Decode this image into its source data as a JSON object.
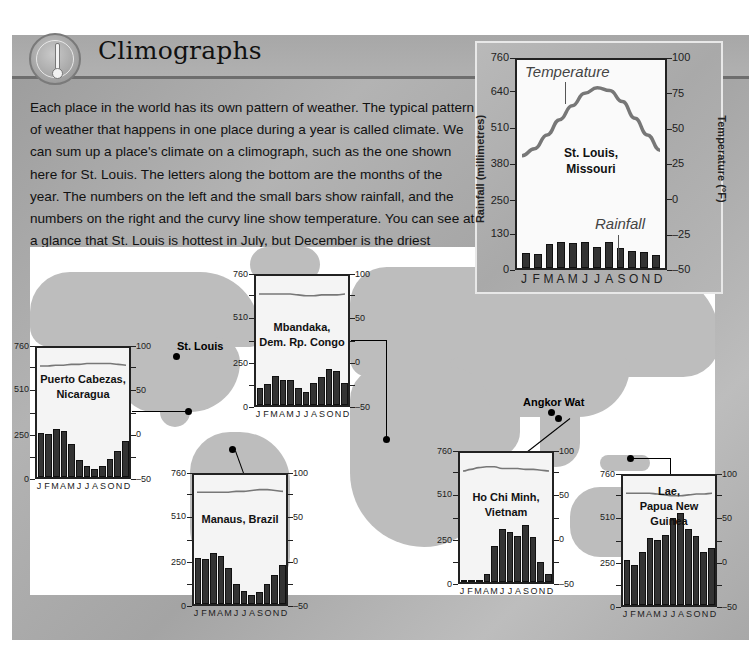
{
  "header": {
    "title": "Climographs",
    "icon": "thermometer-icon"
  },
  "intro_text": "Each place in the world has its own pattern of weather. The typical pattern of weather that happens in one place during a year is called climate. We can sum up a place's climate on a climograph, such as the one shown here for St. Louis. The letters along the bottom are the months of the year. The numbers on the left and the small bars show rainfall, and the numbers on the right and the curvy line show temperature. You can see at a glance that St. Louis is hottest in July, but December is the driest month.",
  "map": {
    "labels": {
      "st_louis": "St. Louis",
      "angkor_wat": "Angkor Wat"
    }
  },
  "colors": {
    "panel": "#a8a8a8",
    "bars": "#333333",
    "temperature_line": "#777777",
    "plot_bg": "#f4f4f4"
  },
  "chart_data": [
    {
      "type": "bar",
      "id": "st_louis",
      "title": "St. Louis, Missouri",
      "title_lines": [
        "St. Louis,",
        "Missouri"
      ],
      "categories": [
        "J",
        "F",
        "M",
        "A",
        "M",
        "J",
        "J",
        "A",
        "S",
        "O",
        "N",
        "D"
      ],
      "ylabel": "Rainfall (millimetres)",
      "y2label": "Temperature (°F)",
      "ylim": [
        0,
        760
      ],
      "y2lim": [
        -50,
        100
      ],
      "yticks": [
        0,
        130,
        250,
        380,
        510,
        640,
        760
      ],
      "y2ticks": [
        -50,
        -25,
        0,
        25,
        50,
        75,
        100
      ],
      "annotations": [
        "Temperature",
        "Rainfall"
      ],
      "series": [
        {
          "name": "Rainfall",
          "type": "bar",
          "values": [
            55,
            52,
            88,
            95,
            92,
            95,
            78,
            95,
            72,
            62,
            60,
            48
          ]
        },
        {
          "name": "Temperature",
          "type": "line",
          "values": [
            31,
            36,
            46,
            57,
            67,
            76,
            80,
            78,
            70,
            58,
            46,
            35
          ]
        }
      ]
    },
    {
      "type": "bar",
      "id": "puerto_cabezas",
      "title": "Puerto Cabezas, Nicaragua",
      "title_lines": [
        "Puerto Cabezas,",
        "Nicaragua"
      ],
      "categories": [
        "J",
        "F",
        "M",
        "A",
        "M",
        "J",
        "J",
        "A",
        "S",
        "O",
        "N",
        "D"
      ],
      "ylim": [
        0,
        760
      ],
      "y2lim": [
        -50,
        100
      ],
      "yticks": [
        0,
        250,
        510,
        760
      ],
      "y2ticks": [
        -50,
        0,
        50,
        100
      ],
      "series": [
        {
          "name": "Rainfall",
          "type": "bar",
          "values": [
            258,
            255,
            285,
            272,
            195,
            100,
            62,
            48,
            62,
            108,
            155,
            215
          ]
        },
        {
          "name": "Temperature",
          "type": "line",
          "values": [
            79,
            79,
            80,
            80,
            81,
            81,
            82,
            82,
            82,
            82,
            81,
            80
          ]
        }
      ]
    },
    {
      "type": "bar",
      "id": "mbandaka",
      "title": "Mbandaka, Dem. Rp. Congo",
      "title_lines": [
        "Mbandaka,",
        "Dem. Rp. Congo"
      ],
      "categories": [
        "J",
        "F",
        "M",
        "A",
        "M",
        "J",
        "J",
        "A",
        "S",
        "O",
        "N",
        "D"
      ],
      "ylim": [
        0,
        760
      ],
      "y2lim": [
        -50,
        100
      ],
      "yticks": [
        0,
        250,
        510,
        760
      ],
      "y2ticks": [
        -50,
        0,
        50,
        100
      ],
      "series": [
        {
          "name": "Rainfall",
          "type": "bar",
          "values": [
            100,
            125,
            170,
            150,
            148,
            98,
            75,
            130,
            165,
            215,
            200,
            128
          ]
        },
        {
          "name": "Temperature",
          "type": "line",
          "values": [
            79,
            79,
            79,
            79,
            79,
            78,
            77,
            77,
            78,
            78,
            78,
            79
          ]
        }
      ]
    },
    {
      "type": "bar",
      "id": "manaus",
      "title": "Manaus, Brazil",
      "title_lines": [
        "Manaus, Brazil"
      ],
      "categories": [
        "J",
        "F",
        "M",
        "A",
        "M",
        "J",
        "J",
        "A",
        "S",
        "O",
        "N",
        "D"
      ],
      "ylim": [
        0,
        760
      ],
      "y2lim": [
        -50,
        100
      ],
      "yticks": [
        0,
        250,
        510,
        760
      ],
      "y2ticks": [
        -50,
        0,
        50,
        100
      ],
      "series": [
        {
          "name": "Rainfall",
          "type": "bar",
          "values": [
            270,
            265,
            300,
            285,
            210,
            115,
            75,
            55,
            70,
            120,
            170,
            228
          ]
        },
        {
          "name": "Temperature",
          "type": "line",
          "values": [
            80,
            80,
            80,
            80,
            80,
            81,
            81,
            82,
            83,
            83,
            82,
            81
          ]
        }
      ]
    },
    {
      "type": "bar",
      "id": "ho_chi_minh",
      "title": "Ho Chi Minh, Vietnam",
      "title_lines": [
        "Ho Chi Minh,",
        "Vietnam"
      ],
      "categories": [
        "J",
        "F",
        "M",
        "A",
        "M",
        "J",
        "J",
        "A",
        "S",
        "O",
        "N",
        "D"
      ],
      "ylim": [
        0,
        760
      ],
      "y2lim": [
        -50,
        100
      ],
      "yticks": [
        0,
        250,
        510,
        760
      ],
      "y2ticks": [
        -50,
        0,
        50,
        100
      ],
      "series": [
        {
          "name": "Rainfall",
          "type": "bar",
          "values": [
            14,
            4,
            12,
            50,
            215,
            310,
            295,
            270,
            335,
            265,
            115,
            48
          ]
        },
        {
          "name": "Temperature",
          "type": "line",
          "values": [
            79,
            81,
            83,
            84,
            84,
            82,
            82,
            82,
            81,
            81,
            80,
            79
          ]
        }
      ]
    },
    {
      "type": "bar",
      "id": "lae",
      "title": "Lae, Papua New Guinea",
      "title_lines": [
        "Lae,",
        "Papua New Guinea"
      ],
      "categories": [
        "J",
        "F",
        "M",
        "A",
        "M",
        "J",
        "J",
        "A",
        "S",
        "O",
        "N",
        "D"
      ],
      "ylim": [
        0,
        760
      ],
      "y2lim": [
        -50,
        100
      ],
      "yticks": [
        0,
        250,
        510,
        760
      ],
      "y2ticks": [
        -50,
        0,
        50,
        100
      ],
      "series": [
        {
          "name": "Rainfall",
          "type": "bar",
          "values": [
            265,
            235,
            315,
            395,
            385,
            415,
            515,
            540,
            445,
            405,
            315,
            335
          ]
        },
        {
          "name": "Temperature",
          "type": "line",
          "values": [
            80,
            80,
            80,
            80,
            79,
            78,
            77,
            77,
            78,
            79,
            79,
            80
          ]
        }
      ]
    }
  ]
}
